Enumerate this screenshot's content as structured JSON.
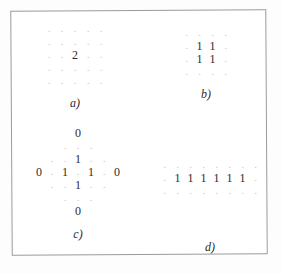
{
  "figure": {
    "background_color": "#ffffff",
    "frame_color": "#9a9a9a",
    "dot_color": "#c9c9c9",
    "value_color": "#2b2b2b",
    "dot_glyph": ".",
    "panels": [
      {
        "id": "a",
        "label": "a)",
        "rows": 5,
        "cols": 5,
        "cells": [
          [
            ".",
            ".",
            ".",
            ".",
            "."
          ],
          [
            ".",
            ".",
            ".",
            ".",
            "."
          ],
          [
            ".",
            ".",
            "2",
            ".",
            "."
          ],
          [
            ".",
            ".",
            ".",
            ".",
            "."
          ],
          [
            ".",
            ".",
            ".",
            ".",
            "."
          ]
        ]
      },
      {
        "id": "b",
        "label": "b)",
        "rows": 4,
        "cols": 4,
        "cells": [
          [
            ".",
            ".",
            ".",
            "."
          ],
          [
            ".",
            "1",
            "1",
            "."
          ],
          [
            ".",
            "1",
            "1",
            "."
          ],
          [
            ".",
            ".",
            ".",
            "."
          ]
        ]
      },
      {
        "id": "c",
        "label": "c)",
        "rows": 7,
        "cols": 7,
        "cells": [
          [
            "",
            "",
            "",
            "0",
            "",
            "",
            ""
          ],
          [
            "",
            "",
            ".",
            ".",
            ".",
            "",
            ""
          ],
          [
            "",
            ".",
            ".",
            "1",
            ".",
            ".",
            ""
          ],
          [
            "0",
            ".",
            "1",
            ".",
            "1",
            ".",
            "0"
          ],
          [
            "",
            ".",
            ".",
            "1",
            ".",
            ".",
            ""
          ],
          [
            "",
            "",
            ".",
            ".",
            ".",
            "",
            ""
          ],
          [
            "",
            "",
            "",
            "0",
            "",
            "",
            ""
          ]
        ]
      },
      {
        "id": "d",
        "label": "d)",
        "rows": 3,
        "cols": 8,
        "cells": [
          [
            ".",
            ".",
            ".",
            ".",
            ".",
            ".",
            ".",
            "."
          ],
          [
            ".",
            "1",
            "1",
            "1",
            "1",
            "1",
            "1",
            "."
          ],
          [
            ".",
            ".",
            ".",
            ".",
            ".",
            ".",
            ".",
            "."
          ]
        ]
      }
    ]
  }
}
